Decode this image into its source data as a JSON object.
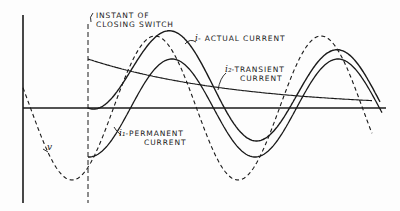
{
  "diagram": {
    "labels": {
      "switch_instant_line1": "INSTANT OF",
      "switch_instant_line2": "CLOSING SWITCH",
      "actual_current_symbol": "i",
      "actual_current_text": "- ACTUAL CURRENT",
      "transient_symbol": "i₂",
      "transient_text_line1": "-TRANSIENT",
      "transient_text_line2": "CURRENT",
      "permanent_symbol": "i₁",
      "permanent_text_line1": "-PERMANENT",
      "permanent_text_line2": "CURRENT",
      "voltage_symbol": "v"
    },
    "curves": [
      {
        "name": "voltage",
        "symbol": "v",
        "style": "dashed"
      },
      {
        "name": "permanent-current",
        "symbol": "i1",
        "style": "solid"
      },
      {
        "name": "transient-current",
        "symbol": "i2",
        "style": "solid"
      },
      {
        "name": "actual-current",
        "symbol": "i",
        "style": "solid"
      }
    ],
    "colors": {
      "ink": "#1a1a1a",
      "paper": "#fdfdfd"
    }
  }
}
